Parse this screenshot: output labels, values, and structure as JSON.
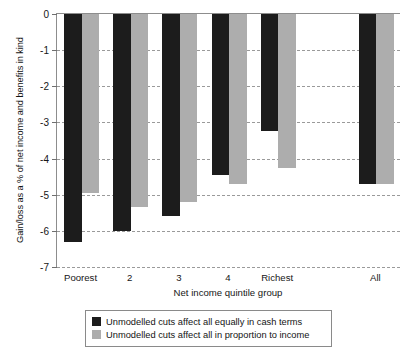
{
  "chart_data": {
    "type": "bar",
    "title": "",
    "xlabel": "Net income quintile group",
    "ylabel": "Gain/loss as a % of net income and benefits in kind",
    "categories": [
      "Poorest",
      "2",
      "3",
      "4",
      "Richest",
      "All"
    ],
    "series": [
      {
        "name": "Unmodelled cuts affect all equally in cash terms",
        "color": "#1c1c1c",
        "values": [
          -6.3,
          -6.0,
          -5.6,
          -4.45,
          -3.25,
          -4.7
        ]
      },
      {
        "name": "Unmodelled cuts affect all in proportion to income",
        "color": "#adadad",
        "values": [
          -4.95,
          -5.35,
          -5.2,
          -4.7,
          -4.25,
          -4.7
        ]
      }
    ],
    "ylim": [
      -7,
      0
    ],
    "yticks": [
      0,
      -1,
      -2,
      -3,
      -4,
      -5,
      -6,
      -7
    ],
    "ytick_labels": [
      "0",
      "-1",
      "-2",
      "-3",
      "-4",
      "-5",
      "-6",
      "-7"
    ],
    "grid": true,
    "grid_axis": "y",
    "legend_position": "below-center",
    "category_gap_after": "Richest"
  },
  "legend": {
    "items": [
      {
        "label": "Unmodelled cuts affect all equally in cash terms",
        "swatch": "s0"
      },
      {
        "label": "Unmodelled cuts affect all in proportion to income",
        "swatch": "s1"
      }
    ]
  }
}
